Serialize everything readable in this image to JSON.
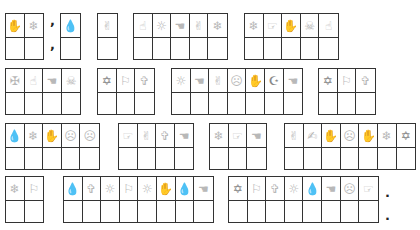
{
  "puzzle": {
    "rows": [
      {
        "top": 13,
        "boxes": [
          {
            "left": 5,
            "icons": [
              "palm-hand",
              "snowflake"
            ],
            "glyphs": [
              "✋",
              "❄"
            ]
          },
          {
            "left": 60,
            "icons": [
              "droplet"
            ],
            "glyphs": [
              "💧"
            ]
          },
          {
            "left": 97,
            "icons": [
              "victory-hand"
            ],
            "glyphs": [
              "✌"
            ]
          },
          {
            "left": 133,
            "icons": [
              "point-up-hand",
              "sun",
              "pointing-hand-left",
              "victory-hand",
              "snowflake"
            ],
            "glyphs": [
              "☝",
              "☼",
              "☚",
              "✌",
              "❄"
            ]
          },
          {
            "left": 244,
            "icons": [
              "snowflake",
              "point-right-hand",
              "palm-hand",
              "skull-crossbones",
              "point-up-hand"
            ],
            "glyphs": [
              "❄",
              "☞",
              "✋",
              "☠",
              "☝"
            ]
          }
        ]
      },
      {
        "top": 68,
        "boxes": [
          {
            "left": 5,
            "icons": [
              "cross-ornament",
              "point-up-hand",
              "pointing-hand-left",
              "skull-crossbones"
            ],
            "glyphs": [
              "✠",
              "☝",
              "☚",
              "☠"
            ]
          },
          {
            "left": 97,
            "icons": [
              "star-of-david",
              "flag",
              "latin-cross"
            ],
            "glyphs": [
              "✡",
              "⚐",
              "✞"
            ]
          },
          {
            "left": 171,
            "icons": [
              "sun",
              "pointing-hand-left",
              "victory-hand",
              "frown-face",
              "palm-hand",
              "crescent-star",
              "pointing-hand-left"
            ],
            "glyphs": [
              "☼",
              "☚",
              "✌",
              "☹",
              "✋",
              "☪",
              "☚"
            ]
          },
          {
            "left": 318,
            "icons": [
              "star-of-david",
              "flag",
              "latin-cross"
            ],
            "glyphs": [
              "✡",
              "⚐",
              "✞"
            ]
          }
        ]
      },
      {
        "top": 123,
        "boxes": [
          {
            "left": 5,
            "icons": [
              "droplet",
              "snowflake",
              "palm-hand",
              "frown-face",
              "frown-face"
            ],
            "glyphs": [
              "💧",
              "❄",
              "✋",
              "☹",
              "☹"
            ]
          },
          {
            "left": 118,
            "icons": [
              "point-right-hand",
              "victory-hand",
              "latin-cross",
              "pointing-hand-left"
            ],
            "glyphs": [
              "☞",
              "✌",
              "✞",
              "☚"
            ]
          },
          {
            "left": 209,
            "icons": [
              "snowflake",
              "point-right-hand",
              "pointing-hand-left"
            ],
            "glyphs": [
              "❄",
              "☞",
              "☚"
            ]
          },
          {
            "left": 284,
            "icons": [
              "victory-hand",
              "writing-hand",
              "palm-hand",
              "frown-face",
              "palm-hand",
              "snowflake",
              "star-of-david"
            ],
            "glyphs": [
              "✌",
              "✍",
              "✋",
              "☹",
              "✋",
              "❄",
              "✡"
            ]
          }
        ]
      },
      {
        "top": 176,
        "boxes": [
          {
            "left": 5,
            "icons": [
              "snowflake",
              "flag"
            ],
            "glyphs": [
              "❄",
              "⚐"
            ]
          },
          {
            "left": 63,
            "icons": [
              "droplet",
              "latin-cross",
              "sun",
              "flag",
              "sun",
              "palm-hand",
              "droplet",
              "pointing-hand-left"
            ],
            "glyphs": [
              "💧",
              "✞",
              "☼",
              "⚐",
              "☼",
              "✋",
              "💧",
              "☚"
            ]
          },
          {
            "left": 228,
            "icons": [
              "star-of-david",
              "flag",
              "latin-cross",
              "sun",
              "droplet",
              "pointing-hand-left",
              "frown-face",
              "point-right-hand"
            ],
            "glyphs": [
              "✡",
              "⚐",
              "✞",
              "☼",
              "💧",
              "☚",
              "☹",
              "☞"
            ]
          }
        ]
      }
    ],
    "marks": [
      {
        "text": ",",
        "left": 50,
        "top": 14
      },
      {
        "text": ",",
        "left": 50,
        "top": 38
      },
      {
        "text": ".",
        "left": 385,
        "top": 186
      },
      {
        "text": ".",
        "left": 385,
        "top": 209
      }
    ]
  }
}
